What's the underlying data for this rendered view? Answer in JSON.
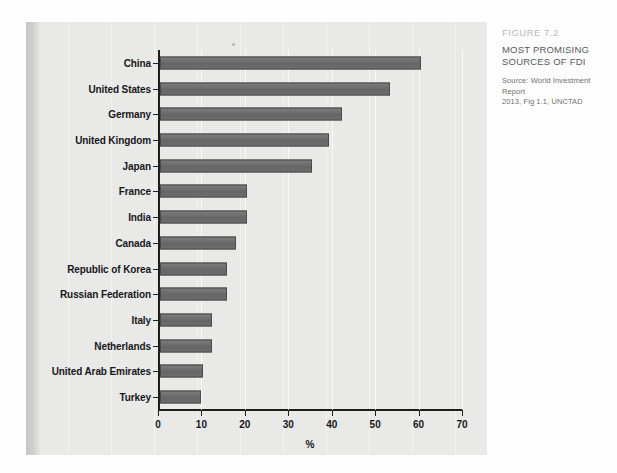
{
  "caption": {
    "figure_number": "FIGURE 7.2",
    "title_line1": "MOST PROMISING",
    "title_line2": "SOURCES OF FDI",
    "source_line1": "Source: World Investment Report",
    "source_line2": "2013, Fig 1.1, UNCTAD"
  },
  "colors": {
    "bar_fill": "#6e6e6e",
    "bar_stroke": "#4b4b4b",
    "panel_background": "#e9e9e7",
    "axis": "#1d1d1d",
    "figure_number_text": "#b9b9b7",
    "title_text": "#58585a",
    "source_text": "#6e6e70"
  },
  "chart_data": {
    "type": "bar",
    "orientation": "horizontal",
    "title": "MOST PROMISING SOURCES OF FDI",
    "subtitle": "FIGURE 7.2",
    "source": "Source: World Investment Report 2013, Fig 1.1, UNCTAD",
    "xlabel": "%",
    "ylabel": "",
    "xlim": [
      0,
      70
    ],
    "xticks": [
      0,
      10,
      20,
      30,
      40,
      50,
      60,
      70
    ],
    "xtick_labels": [
      "0",
      "10",
      "20",
      "30",
      "40",
      "50",
      "60",
      "70"
    ],
    "grid": true,
    "grid_axis": "x",
    "legend": false,
    "categories": [
      "China",
      "United States",
      "Germany",
      "United Kingdom",
      "Japan",
      "France",
      "India",
      "Canada",
      "Republic of Korea",
      "Russian Federation",
      "Italy",
      "Netherlands",
      "United Arab Emirates",
      "Turkey"
    ],
    "values": [
      60,
      53,
      42,
      39,
      35,
      20,
      20,
      17.5,
      15.5,
      15.5,
      12,
      12,
      10,
      9.5
    ],
    "series": [
      {
        "name": "Share of respondents",
        "values": [
          60,
          53,
          42,
          39,
          35,
          20,
          20,
          17.5,
          15.5,
          15.5,
          12,
          12,
          10,
          9.5
        ]
      }
    ]
  }
}
